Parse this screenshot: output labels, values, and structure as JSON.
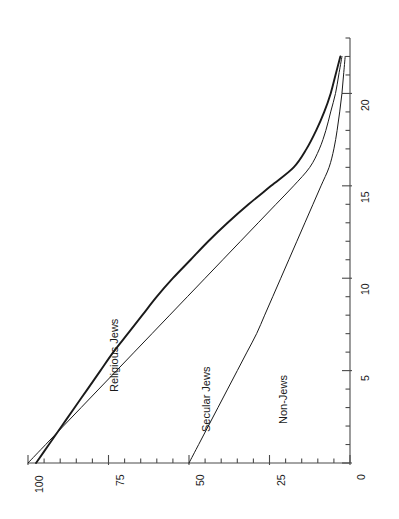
{
  "chart_data": {
    "type": "line",
    "title": "",
    "subtitle": "",
    "orientation": "rotated-90-ccw",
    "xlabel": "",
    "ylabel": "",
    "xlim": [
      0,
      23
    ],
    "ylim": [
      0,
      100
    ],
    "x_axis": {
      "name": "years-axis",
      "position": "right-vertical",
      "min": 0,
      "max": 23,
      "major_tick_step": 5,
      "minor_tick_step": 1,
      "tick_labels": [
        "0",
        "5",
        "10",
        "15",
        "20"
      ],
      "tick_values": [
        0,
        5,
        10,
        15,
        20
      ]
    },
    "y_axis": {
      "name": "percent-axis",
      "position": "bottom-horizontal",
      "min": 0,
      "max": 100,
      "direction": "right-to-left",
      "major_tick_step": 25,
      "minor_tick_step": 5,
      "tick_labels": [
        "0",
        "25",
        "50",
        "75",
        "100"
      ],
      "tick_values": [
        0,
        25,
        50,
        75,
        100
      ]
    },
    "grid": false,
    "legend_position": "inline-curve-labels",
    "series": [
      {
        "name": "Religious Jews",
        "label": "Religious Jews",
        "color": "#1a1a1a",
        "line_width": 1.9,
        "x": [
          0,
          1,
          2,
          3,
          4,
          5,
          6,
          7,
          8,
          9,
          10,
          11,
          12,
          13,
          14,
          15,
          16,
          17,
          18,
          19,
          20,
          21,
          22
        ],
        "values": [
          97.5,
          93.5,
          89.5,
          85.5,
          81.5,
          77.5,
          73.5,
          69.0,
          64.5,
          60.0,
          55.0,
          49.5,
          44.0,
          38.0,
          31.5,
          24.5,
          17.5,
          13.5,
          10.5,
          8.0,
          6.0,
          4.5,
          3.0
        ]
      },
      {
        "name": "Secular Jews",
        "label": "Secular Jews",
        "color": "#1a1a1a",
        "line_width": 1.0,
        "x": [
          0,
          1,
          2,
          3,
          4,
          5,
          6,
          7,
          8,
          9,
          10,
          11,
          12,
          13,
          14,
          15,
          16,
          17,
          18,
          19,
          20,
          21,
          22
        ],
        "values": [
          100.0,
          94.5,
          89.0,
          83.5,
          78.0,
          72.5,
          67.0,
          61.5,
          56.0,
          50.5,
          45.0,
          39.5,
          34.0,
          28.5,
          23.0,
          17.5,
          12.5,
          9.5,
          7.5,
          6.0,
          4.5,
          3.5,
          2.5
        ]
      },
      {
        "name": "Non-Jews",
        "label": "Non-Jews",
        "color": "#1a1a1a",
        "line_width": 1.0,
        "x": [
          0,
          1,
          2,
          3,
          4,
          5,
          6,
          7,
          8,
          9,
          10,
          11,
          12,
          13,
          14,
          15,
          16,
          17,
          18,
          19,
          20,
          21,
          22
        ],
        "values": [
          50.0,
          47.0,
          44.0,
          41.0,
          38.0,
          35.0,
          32.0,
          29.0,
          26.5,
          24.0,
          21.5,
          19.0,
          16.5,
          14.0,
          11.5,
          9.0,
          6.5,
          5.0,
          4.0,
          3.2,
          2.5,
          2.0,
          1.5
        ]
      }
    ]
  },
  "series_annotations": [
    {
      "name": "religious-jews-label",
      "text": "Religious Jews"
    },
    {
      "name": "secular-jews-label",
      "text": "Secular Jews"
    },
    {
      "name": "non-jews-label",
      "text": "Non-Jews"
    }
  ]
}
